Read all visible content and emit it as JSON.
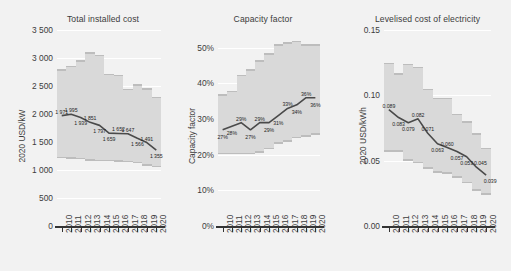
{
  "figure": {
    "background_color": "#f2f2f2",
    "band_color": "#d9d9d9",
    "band_edge_color": "#bdbdbd",
    "line_color": "#4a4a4a",
    "text_color": "#3c3c3c"
  },
  "panels": [
    {
      "id": "cost",
      "title": "Total installed cost",
      "ylabel": "2020 USD/kW"
    },
    {
      "id": "cf",
      "title": "Capacity factor",
      "ylabel": "Capacity factor"
    },
    {
      "id": "lcoe",
      "title": "Levelised cost of electricity",
      "ylabel": "2020 USD/kWh"
    }
  ],
  "chart_data": [
    {
      "type": "line",
      "id": "total-installed-cost",
      "title": "Total installed cost",
      "xlabel": "",
      "ylabel": "2020 USD/kW",
      "categories": [
        "2010",
        "2011",
        "2012",
        "2013",
        "2014",
        "2015",
        "2016",
        "2017",
        "2018",
        "2019",
        "2020"
      ],
      "ylim": [
        0,
        3500
      ],
      "yticks": [
        0,
        500,
        1000,
        1500,
        2000,
        2500,
        3000,
        3500
      ],
      "ytick_labels": [
        "0",
        "500",
        "1 000",
        "1 500",
        "2 000",
        "2 500",
        "3 000",
        "3 500"
      ],
      "grid": true,
      "legend": "none",
      "series": [
        {
          "name": "Weighted average",
          "values": [
            1971,
            1995,
            1939,
            1851,
            1797,
            1659,
            1652,
            1647,
            1566,
            1491,
            1355
          ],
          "labels": [
            "1 971",
            "1 995",
            "1 939",
            "1 851",
            "1 797",
            "1 659",
            "1 652",
            "1 647",
            "1 566",
            "1 491",
            "1 355"
          ]
        },
        {
          "name": "95th percentile (band top)",
          "values": [
            2800,
            2860,
            2960,
            3100,
            3060,
            2720,
            2700,
            2450,
            2530,
            2460,
            2310
          ]
        },
        {
          "name": "5th percentile (band bottom)",
          "values": [
            1240,
            1230,
            1220,
            1190,
            1180,
            1180,
            1170,
            1160,
            1150,
            1100,
            1080
          ]
        }
      ]
    },
    {
      "type": "line",
      "id": "capacity-factor",
      "title": "Capacity factor",
      "xlabel": "",
      "ylabel": "Capacity factor",
      "categories": [
        "2010",
        "2011",
        "2012",
        "2013",
        "2014",
        "2015",
        "2016",
        "2017",
        "2018",
        "2019",
        "2020"
      ],
      "ylim": [
        0,
        55
      ],
      "yticks": [
        0,
        10,
        20,
        30,
        40,
        50
      ],
      "ytick_labels": [
        "0%",
        "10%",
        "20%",
        "30%",
        "40%",
        "50%"
      ],
      "grid": true,
      "legend": "none",
      "series": [
        {
          "name": "Weighted average",
          "values": [
            27,
            28,
            29,
            27,
            29,
            29,
            31,
            33,
            34,
            36,
            36
          ],
          "labels": [
            "27%",
            "28%",
            "29%",
            "27%",
            "29%",
            "29%",
            "31%",
            "33%",
            "34%",
            "36%",
            "36%"
          ]
        },
        {
          "name": "95th percentile (band top)",
          "values": [
            37,
            38,
            42.5,
            44,
            46.5,
            48.5,
            51,
            51.5,
            52,
            51,
            51
          ]
        },
        {
          "name": "5th percentile (band bottom)",
          "values": [
            20.5,
            20.5,
            20.5,
            20.5,
            21,
            22,
            23.5,
            24,
            25,
            25.5,
            26
          ]
        }
      ]
    },
    {
      "type": "line",
      "id": "levelised-cost-of-electricity",
      "title": "Levelised cost of electricity",
      "xlabel": "",
      "ylabel": "2020 USD/kWh",
      "categories": [
        "2010",
        "2011",
        "2012",
        "2013",
        "2014",
        "2015",
        "2016",
        "2017",
        "2018",
        "2019",
        "2020"
      ],
      "ylim": [
        0,
        0.15
      ],
      "yticks": [
        0,
        0.05,
        0.1,
        0.15
      ],
      "ytick_labels": [
        "0.00",
        "0.05",
        "0.10",
        "0.15"
      ],
      "grid": true,
      "legend": "none",
      "series": [
        {
          "name": "Weighted average",
          "values": [
            0.089,
            0.083,
            0.079,
            0.082,
            0.071,
            0.063,
            0.06,
            0.057,
            0.053,
            0.045,
            0.039
          ],
          "labels": [
            "0.089",
            "0.083",
            "0.079",
            "0.082",
            "0.071",
            "0.063",
            "0.060",
            "0.057",
            "0.053",
            "0.045",
            "0.039"
          ]
        },
        {
          "name": "95th percentile (band top)",
          "values": [
            0.125,
            0.117,
            0.124,
            0.122,
            0.105,
            0.098,
            0.098,
            0.086,
            0.08,
            0.071,
            0.06
          ]
        },
        {
          "name": "5th percentile (band bottom)",
          "values": [
            0.058,
            0.058,
            0.051,
            0.049,
            0.045,
            0.042,
            0.041,
            0.038,
            0.034,
            0.028,
            0.025
          ]
        }
      ]
    }
  ]
}
